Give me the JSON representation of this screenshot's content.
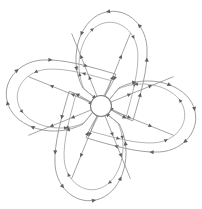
{
  "figure": {
    "title": "Four-petal heart flow diagram",
    "background_color": "#ffffff",
    "stroke_color": "#9a9a9a",
    "inner_stroke_color": "#a8a8a8",
    "spoke_color": "#8f8f8f",
    "hub_stroke_color": "#7d7d7d",
    "arrow_color": "#5e5e5e",
    "canvas": {
      "width": 202,
      "height": 209
    },
    "hub": {
      "cx": 101,
      "cy": 106,
      "r": 10.5,
      "label": "center-hub"
    },
    "petal_count": 4,
    "petals": [
      {
        "name": "petal-top-left",
        "rotation_deg": 225,
        "flow_direction": "counterclockwise",
        "outer_arrow_count": 8,
        "inner_arrow_count": 5
      },
      {
        "name": "petal-top-right",
        "rotation_deg": 315,
        "flow_direction": "clockwise",
        "outer_arrow_count": 8,
        "inner_arrow_count": 5
      },
      {
        "name": "petal-bottom-right",
        "rotation_deg": 45,
        "flow_direction": "counterclockwise",
        "outer_arrow_count": 8,
        "inner_arrow_count": 5
      },
      {
        "name": "petal-bottom-left",
        "rotation_deg": 135,
        "flow_direction": "clockwise",
        "outer_arrow_count": 8,
        "inner_arrow_count": 5
      }
    ],
    "spokes": [
      {
        "name": "spoke-upper-left",
        "angle_deg": 202,
        "arrow_count": 2
      },
      {
        "name": "spoke-upper-right",
        "angle_deg": 338,
        "arrow_count": 2
      },
      {
        "name": "spoke-lower-left",
        "angle_deg": 158,
        "arrow_count": 2
      },
      {
        "name": "spoke-lower-right",
        "angle_deg": 22,
        "arrow_count": 2
      },
      {
        "name": "spoke-top-left",
        "angle_deg": 248,
        "arrow_count": 2
      },
      {
        "name": "spoke-top-right",
        "angle_deg": 292,
        "arrow_count": 2
      },
      {
        "name": "spoke-bottom-left",
        "angle_deg": 112,
        "arrow_count": 2
      },
      {
        "name": "spoke-bottom-right",
        "angle_deg": 68,
        "arrow_count": 2
      }
    ],
    "geometry": {
      "petal_outer_path": "M 0 -13 C 10 -44 44 -62 66 -52 C 88 -42 90 -14 74 4 C 60 20 34 34 12 46 C 6 34 2 14 0 -13 Z",
      "petal_inner_path": "M 0 -11 C 10 -38 40 -53 58 -45 C 76 -37 77 -14 64 1 C 52 15 30 27 11 38 C 6 27 2 12 0 -11 Z",
      "petal_scale": 1.0,
      "petal_offset": 13
    }
  }
}
